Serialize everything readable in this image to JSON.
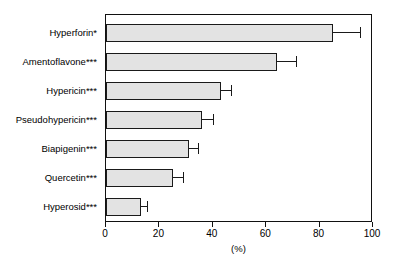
{
  "chart_data": {
    "type": "bar",
    "orientation": "horizontal",
    "title": "",
    "xlabel": "(%)",
    "ylabel": "",
    "xlim": [
      0,
      100
    ],
    "xticks": [
      0,
      20,
      40,
      60,
      80,
      100
    ],
    "xticklabels": [
      "0",
      "20",
      "40",
      "60",
      "80",
      "100"
    ],
    "grid": false,
    "legend": false,
    "categories": [
      "Hyperforin*",
      "Amentoflavone***",
      "Hypericin***",
      "Pseudohypericin***",
      "Biapigenin***",
      "Quercetin***",
      "Hyperosid***"
    ],
    "values": [
      85,
      64,
      43,
      36,
      31,
      25,
      13
    ],
    "errors": [
      10,
      7,
      4,
      4,
      3.5,
      4,
      2.5
    ],
    "bars": [
      {
        "label": "Hyperforin*",
        "value": 85,
        "error": 10
      },
      {
        "label": "Amentoflavone***",
        "value": 64,
        "error": 7
      },
      {
        "label": "Hypericin***",
        "value": 43,
        "error": 4
      },
      {
        "label": "Pseudohypericin***",
        "value": 36,
        "error": 4
      },
      {
        "label": "Biapigenin***",
        "value": 31,
        "error": 3.5
      },
      {
        "label": "Quercetin***",
        "value": 25,
        "error": 4
      },
      {
        "label": "Hyperosid***",
        "value": 13,
        "error": 2.5
      }
    ],
    "colors": {
      "bar_fill": "#e3e3e3",
      "bar_edge": "#1a1a1a",
      "axis": "#111111",
      "background": "#ffffff"
    }
  }
}
